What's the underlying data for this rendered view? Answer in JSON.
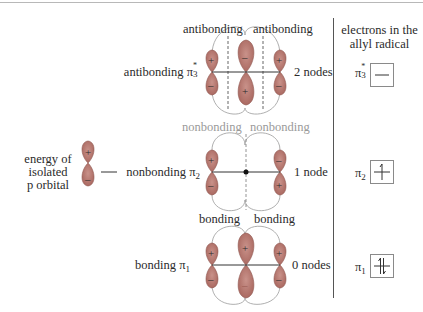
{
  "figure": {
    "colors": {
      "lobe_fill": "#b87a72",
      "lobe_stroke": "#8f5750",
      "envelope": "#9a9a9a",
      "node_line": "#555555",
      "text": "#2a2a2a",
      "muted_text": "#9a9a9a"
    },
    "isolated": {
      "label_lines": [
        "energy of",
        "isolated",
        "p orbital"
      ],
      "plus": "+",
      "minus": "–"
    },
    "levels": [
      {
        "id": "pi3",
        "name": "antibonding",
        "symbol": "π",
        "subscript": "3",
        "superscript": "*",
        "interaction_labels": [
          "antibonding",
          "antibonding"
        ],
        "nodes_label": "2 nodes",
        "top_signs": [
          "+",
          "–",
          "+"
        ],
        "bottom_signs": [
          "–",
          "+",
          "–"
        ],
        "electrons": 0
      },
      {
        "id": "pi2",
        "name": "nonbonding",
        "symbol": "π",
        "subscript": "2",
        "superscript": "",
        "interaction_labels": [
          "nonbonding",
          "nonbonding"
        ],
        "nodes_label": "1 node",
        "top_signs": [
          "+",
          "",
          "–"
        ],
        "bottom_signs": [
          "–",
          "",
          "+"
        ],
        "electrons": 1
      },
      {
        "id": "pi1",
        "name": "bonding",
        "symbol": "π",
        "subscript": "1",
        "superscript": "",
        "interaction_labels": [
          "bonding",
          "bonding"
        ],
        "nodes_label": "0 nodes",
        "top_signs": [
          "+",
          "+",
          "+"
        ],
        "bottom_signs": [
          "–",
          "–",
          "–"
        ],
        "electrons": 2
      }
    ],
    "electrons_header_lines": [
      "electrons in the",
      "allyl radical"
    ]
  }
}
